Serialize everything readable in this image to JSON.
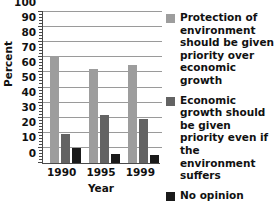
{
  "chart_data": {
    "type": "bar",
    "title": "",
    "subtitle": "",
    "xlabel": "Year",
    "ylabel": "Percent",
    "categories": [
      "1990",
      "1995",
      "1999"
    ],
    "series": [
      {
        "name": "Protection of environment should be given priority over economic growth",
        "color": "#9d9d9d",
        "values": [
          71,
          62,
          65
        ]
      },
      {
        "name": "Economic growth should be given priority even if the environment suffers",
        "color": "#636363",
        "values": [
          19,
          32,
          29
        ]
      },
      {
        "name": "No opinion",
        "color": "#1a1a1a",
        "values": [
          10,
          6,
          5
        ]
      }
    ],
    "ylim": [
      0,
      100
    ],
    "ytick_values": [
      0,
      10,
      20,
      30,
      40,
      50,
      60,
      70,
      80,
      90,
      100
    ],
    "ytick_labels": [
      "0",
      "10",
      "20",
      "30",
      "40",
      "50",
      "60",
      "70",
      "80",
      "90",
      "100"
    ],
    "y_minor_tick_step": 2,
    "grid": "horizontal",
    "grid_color": "#9a9a9a",
    "legend_position": "right",
    "legend_entries": [
      "Protection of environment should be given priority over economic growth",
      "Economic growth should be given priority even if the environment suffers",
      "No opinion"
    ],
    "annotations": []
  },
  "axis": {
    "y_title": "Percent",
    "x_title": "Year"
  }
}
